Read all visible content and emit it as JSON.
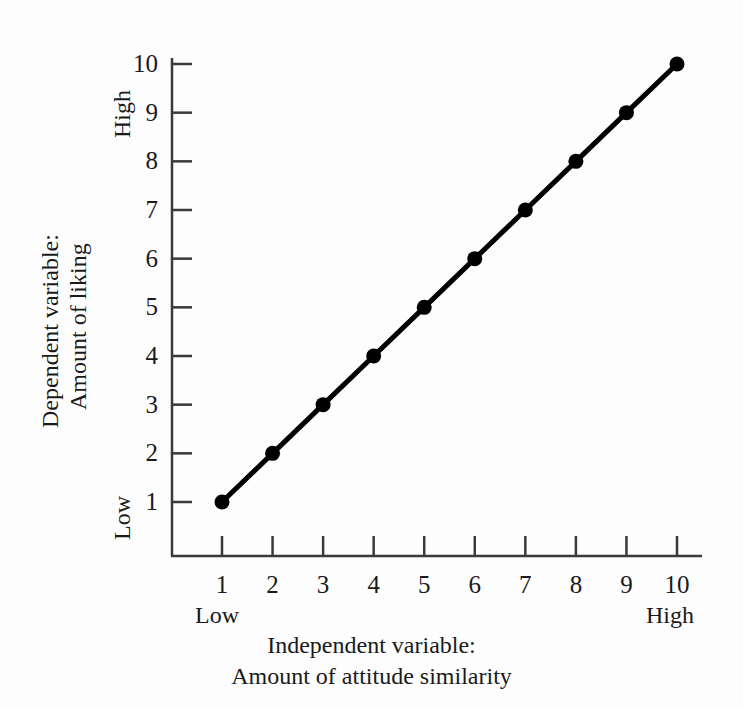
{
  "chart_data": {
    "type": "line",
    "title": "",
    "subtitle": "",
    "xlabel": "Independent variable:\nAmount of attitude similarity",
    "xlabel_line1": "Independent variable:",
    "xlabel_line2": "Amount of attitude similarity",
    "ylabel": "Dependent variable:\nAmount of liking",
    "ylabel_line1": "Dependent variable:",
    "ylabel_line2": "Amount of liking",
    "x": [
      1,
      2,
      3,
      4,
      5,
      6,
      7,
      8,
      9,
      10
    ],
    "values": [
      1,
      2,
      3,
      4,
      5,
      6,
      7,
      8,
      9,
      10
    ],
    "series": [
      {
        "name": "Amount of liking",
        "values": [
          1,
          2,
          3,
          4,
          5,
          6,
          7,
          8,
          9,
          10
        ]
      }
    ],
    "xticks": [
      "1",
      "2",
      "3",
      "4",
      "5",
      "6",
      "7",
      "8",
      "9",
      "10"
    ],
    "yticks": [
      "1",
      "2",
      "3",
      "4",
      "5",
      "6",
      "7",
      "8",
      "9",
      "10"
    ],
    "xlim": [
      1,
      10
    ],
    "ylim": [
      1,
      10
    ],
    "x_low_label": "Low",
    "x_high_label": "High",
    "y_low_label": "Low",
    "y_high_label": "High",
    "grid": false,
    "legend": false,
    "legend_position": "none",
    "line_color": "#000000",
    "marker_color": "#000000",
    "axis_color": "#3a3a3a",
    "background_color": "#fdfdfd",
    "marker": "circle",
    "annotations": []
  }
}
